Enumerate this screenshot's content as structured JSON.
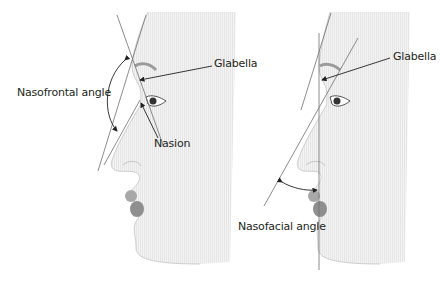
{
  "figure": {
    "left_panel": {
      "labels": {
        "angle": "Nasofrontal angle",
        "glabella": "Glabella",
        "nasion": "Nasion"
      }
    },
    "right_panel": {
      "labels": {
        "glabella": "Glabella",
        "angle": "Nasofacial angle"
      }
    },
    "colors": {
      "line": "#6d6e71",
      "text": "#231f20",
      "lips": "#9a9a9a",
      "skin_shade": "#e6e6e6"
    }
  }
}
